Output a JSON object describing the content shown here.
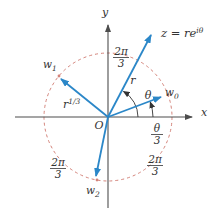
{
  "figure": {
    "colors": {
      "vector_blue": "#2b87c8",
      "circle_salmon": "#d4837a",
      "axis_gray": "#4d4d4d",
      "label_ink": "#333333",
      "background": "#ffffff"
    },
    "axis": {
      "x": "x",
      "y": "y"
    },
    "origin": "O",
    "z_label": {
      "base": "z = re",
      "sup": "iθ"
    },
    "r_label": "r",
    "root_modulus_label": {
      "base": "r",
      "sup": "1/3"
    },
    "theta_label": "θ",
    "theta_third": {
      "num": "θ",
      "den": "3"
    },
    "two_pi_third": {
      "num": "2π",
      "den": "3"
    },
    "roots": [
      {
        "base": "w",
        "sub": "0"
      },
      {
        "base": "w",
        "sub": "1"
      },
      {
        "base": "w",
        "sub": "2"
      }
    ]
  }
}
